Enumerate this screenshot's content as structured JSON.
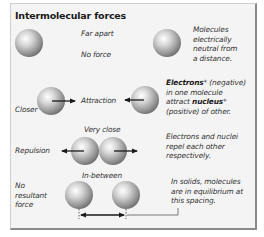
{
  "title": "Intermolecular forces",
  "rows": [
    {
      "name": "far-apart",
      "label_top": "Far apart",
      "label_bottom": "No force",
      "description": [
        "Molecules",
        "electrically",
        "neutral from",
        "a distance."
      ]
    },
    {
      "name": "closer",
      "left_label": "Closer",
      "center_label": "Attraction",
      "description_parts": {
        "line1_bold": "Electrons",
        "line1_rest": "* (negative)",
        "line2": "in one molecule",
        "line3_pre": "attract ",
        "line3_bold": "nucleus",
        "line3_post": "*",
        "line4": "(positive) of other."
      }
    },
    {
      "name": "very-close",
      "top_label": "Very close",
      "left_label": "Repulsion",
      "description": [
        "Electrons and nuclei",
        "repel each other",
        "respectively."
      ]
    },
    {
      "name": "in-between",
      "top_label": "In-between",
      "left_label": [
        "No",
        "resultant",
        "force"
      ],
      "description": [
        "In solids, molecules",
        "are in equilibrium at",
        "this spacing."
      ]
    }
  ],
  "colors": {
    "panel_background": "#f4f4f4",
    "panel_border_dark": "#8a8a8a",
    "sphere_highlight": "#ffffff",
    "sphere_shadow": "#6e6e6e",
    "arrow": "#1a1a1a",
    "text": "#333333"
  }
}
